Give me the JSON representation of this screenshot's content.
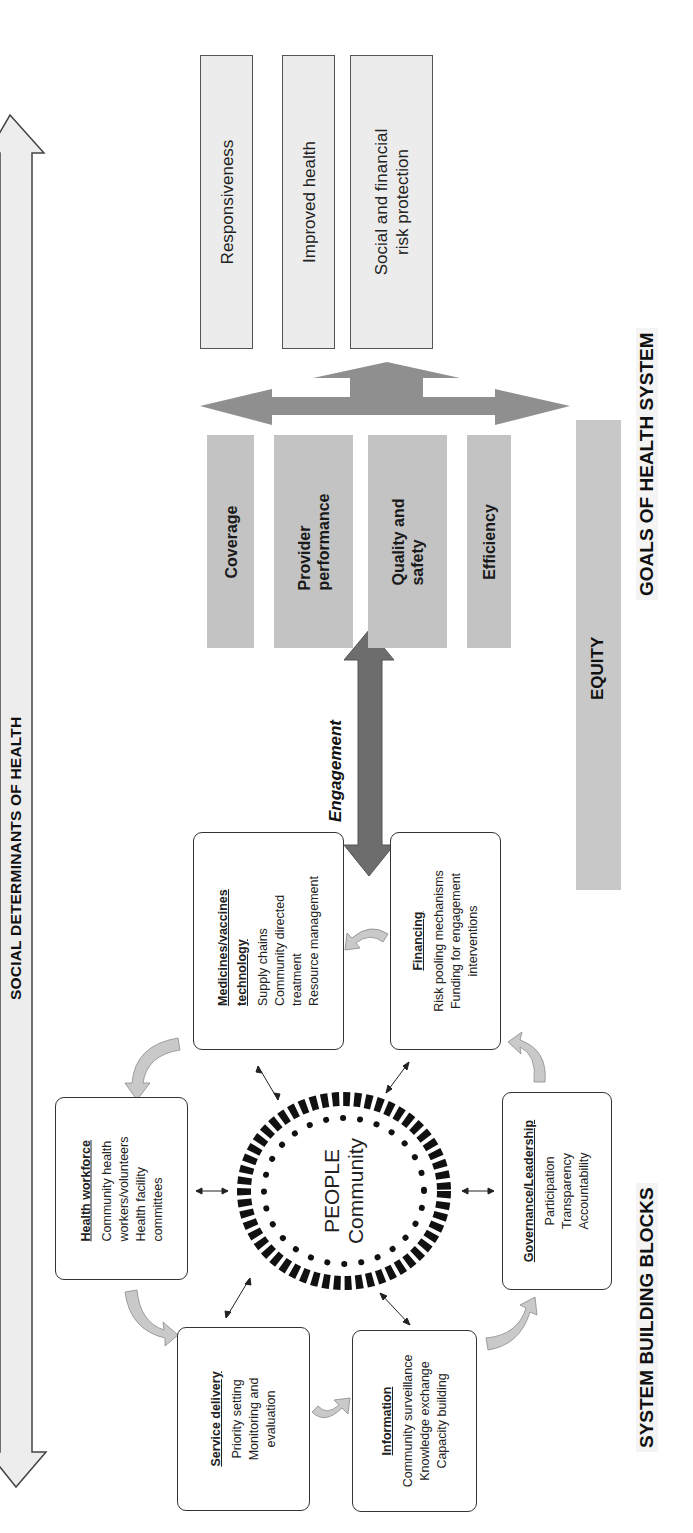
{
  "social_determinants": {
    "label": "SOCIAL DETERMINANTS OF HEALTH"
  },
  "goals": {
    "heading": "GOALS OF HEALTH SYSTEM",
    "items": [
      {
        "label": "Responsiveness"
      },
      {
        "label": "Improved health"
      },
      {
        "label": "Social and financial risk protection",
        "line1": "Social and financial",
        "line2": "risk protection"
      }
    ]
  },
  "performance": {
    "items": [
      {
        "line1": "Coverage",
        "line2": ""
      },
      {
        "line1": "Provider",
        "line2": "performance"
      },
      {
        "line1": "Quality and",
        "line2": "safety"
      },
      {
        "line1": "Efficiency",
        "line2": ""
      }
    ]
  },
  "equity": {
    "label": "EQUITY"
  },
  "engagement": {
    "label": "Engagement"
  },
  "building_blocks": {
    "heading": "SYSTEM BUILDING BLOCKS",
    "center": {
      "line1": "PEOPLE",
      "line2": "Community"
    },
    "medicines": {
      "title1": "Medicines/vaccines",
      "title2": "technology",
      "items": [
        "Supply chains",
        "Community directed",
        "treatment",
        "Resource management"
      ]
    },
    "financing": {
      "title": "Financing",
      "items": [
        "Risk pooling mechanisms",
        "Funding for engagement",
        "interventions"
      ]
    },
    "health_workforce": {
      "title": "Health workforce",
      "items": [
        "Community health",
        "workers/volunteers",
        "Health facility",
        "committees"
      ]
    },
    "service_delivery": {
      "title": "Service delivery",
      "items": [
        "Priority setting",
        "Monitoring and",
        "evaluation"
      ]
    },
    "information": {
      "title": "Information",
      "items": [
        "Community surveillance",
        "Knowledge exchange",
        "Capacity building"
      ]
    },
    "governance": {
      "title": "Governance/Leadership",
      "items": [
        "Participation",
        "Transparency",
        "Accountability"
      ]
    }
  },
  "colors": {
    "goal_box_fill": "#ececec",
    "performance_fill": "#c3c3c3",
    "equity_fill": "#c8c8c8",
    "big_arrow": "#8f8f8f",
    "engagement_arrow": "#6d6d6d",
    "cycle_arrow": "#c9c9c9",
    "people_ring": "#111111"
  }
}
